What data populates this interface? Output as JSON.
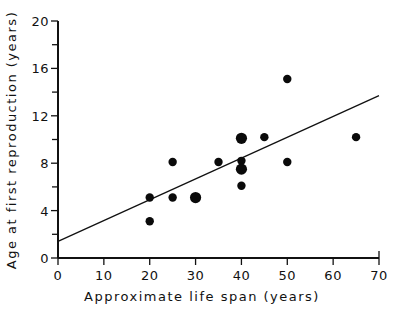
{
  "chart_data": {
    "type": "scatter",
    "title": "",
    "xlabel": "Approximate life span (years)",
    "ylabel": "Age at first reproduction (years)",
    "xlim": [
      0,
      70
    ],
    "ylim": [
      0,
      20
    ],
    "x_ticks": [
      0,
      10,
      20,
      30,
      40,
      50,
      60,
      70
    ],
    "y_ticks": [
      0,
      4,
      8,
      12,
      16,
      20
    ],
    "y_minor_ticks": [
      2,
      6,
      10,
      14,
      18
    ],
    "grid": false,
    "legend": null,
    "points": [
      {
        "x": 20,
        "y": 5.1,
        "size": "small"
      },
      {
        "x": 20,
        "y": 3.1,
        "size": "small"
      },
      {
        "x": 25,
        "y": 8.1,
        "size": "small"
      },
      {
        "x": 25,
        "y": 5.1,
        "size": "small"
      },
      {
        "x": 30,
        "y": 5.1,
        "size": "large"
      },
      {
        "x": 35,
        "y": 8.1,
        "size": "small"
      },
      {
        "x": 40,
        "y": 10.1,
        "size": "large"
      },
      {
        "x": 40,
        "y": 8.2,
        "size": "small"
      },
      {
        "x": 40,
        "y": 7.5,
        "size": "large"
      },
      {
        "x": 40,
        "y": 6.1,
        "size": "small"
      },
      {
        "x": 45,
        "y": 10.2,
        "size": "small"
      },
      {
        "x": 50,
        "y": 15.1,
        "size": "small"
      },
      {
        "x": 50,
        "y": 8.1,
        "size": "small"
      },
      {
        "x": 65,
        "y": 10.2,
        "size": "small"
      }
    ],
    "regression_line": {
      "x0": 0,
      "y0": 1.4,
      "x1": 70,
      "y1": 13.7
    }
  }
}
